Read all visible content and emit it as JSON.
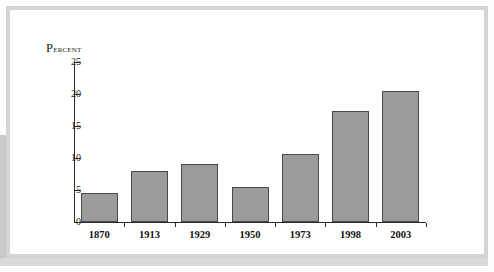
{
  "figure": {
    "panel_background": "#ffffff",
    "frame_color": "#d4d4d4",
    "bar_fill": "#9b9b9b",
    "bar_stroke": "#4a4a4a",
    "axis_color": "#2b2b2b"
  },
  "chart_data": {
    "type": "bar",
    "title": "",
    "xlabel": "",
    "ylabel": "Percent",
    "ylabel_display_cap": "P",
    "ylabel_display_rest": "ercent",
    "categories": [
      "1870",
      "1913",
      "1929",
      "1950",
      "1973",
      "1998",
      "2003"
    ],
    "values": [
      4.6,
      8.0,
      9.1,
      5.5,
      10.7,
      17.3,
      20.5
    ],
    "ylim": [
      0,
      25
    ],
    "yticks": [
      0,
      5,
      10,
      15,
      20,
      25
    ],
    "ytick_labels": [
      "0",
      "5",
      "10",
      "15",
      "20",
      "25"
    ],
    "grid": false,
    "legend": null,
    "annotations": []
  }
}
